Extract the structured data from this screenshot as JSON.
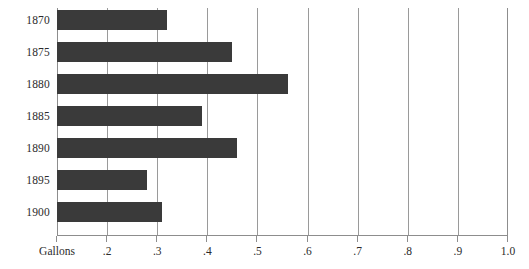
{
  "chart_data": {
    "type": "bar",
    "orientation": "horizontal",
    "title": "",
    "subtitle": "",
    "xlabel": "Gallons",
    "ylabel": "",
    "categories": [
      "1870",
      "1875",
      "1880",
      "1885",
      "1890",
      "1895",
      "1900"
    ],
    "values": [
      0.32,
      0.45,
      0.56,
      0.39,
      0.46,
      0.28,
      0.31
    ],
    "series": [
      {
        "name": "Gallons",
        "values": [
          0.32,
          0.45,
          0.56,
          0.39,
          0.46,
          0.28,
          0.31
        ]
      }
    ],
    "xlim": [
      0.1,
      1.0
    ],
    "xticks": [
      0.1,
      0.2,
      0.3,
      0.4,
      0.5,
      0.6,
      0.7,
      0.8,
      0.9,
      1.0
    ],
    "xtick_labels": [
      "Gallons",
      ".2",
      ".3",
      ".4",
      ".5",
      ".6",
      ".7",
      ".8",
      ".9",
      "1.0"
    ],
    "grid": true,
    "grid_axis": "x",
    "legend": false,
    "legend_position": "none",
    "bar_color": "#3a3a3a",
    "grid_color": "#9a9a9a",
    "axis_color": "#8d8d8d",
    "background_color": "#ffffff",
    "annotations": []
  },
  "axis": {
    "x_title": "Gallons",
    "ticks": [
      {
        "value": 0.1,
        "label": "Gallons",
        "is_axis_title": true
      },
      {
        "value": 0.2,
        "label": ".2",
        "is_axis_title": false
      },
      {
        "value": 0.3,
        "label": ".3",
        "is_axis_title": false
      },
      {
        "value": 0.4,
        "label": ".4",
        "is_axis_title": false
      },
      {
        "value": 0.5,
        "label": ".5",
        "is_axis_title": false
      },
      {
        "value": 0.6,
        "label": ".6",
        "is_axis_title": false
      },
      {
        "value": 0.7,
        "label": ".7",
        "is_axis_title": false
      },
      {
        "value": 0.8,
        "label": ".8",
        "is_axis_title": false
      },
      {
        "value": 0.9,
        "label": ".9",
        "is_axis_title": false
      },
      {
        "value": 1.0,
        "label": "1.0",
        "is_axis_title": false
      }
    ]
  },
  "rows": [
    {
      "year": "1870",
      "value": 0.32
    },
    {
      "year": "1875",
      "value": 0.45
    },
    {
      "year": "1880",
      "value": 0.56
    },
    {
      "year": "1885",
      "value": 0.39
    },
    {
      "year": "1890",
      "value": 0.46
    },
    {
      "year": "1895",
      "value": 0.28
    },
    {
      "year": "1900",
      "value": 0.31
    }
  ]
}
